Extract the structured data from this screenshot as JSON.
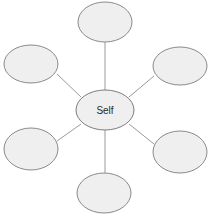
{
  "diagram": {
    "type": "radial-web-diagram",
    "canvas": {
      "width": 210,
      "height": 217,
      "background": "#ffffff"
    },
    "style": {
      "node_fill": "#efefef",
      "node_stroke": "#8a8a8a",
      "connector_stroke": "#9a9a9a",
      "label_color": "#2a2a2a"
    },
    "center": {
      "label": "Self",
      "cx": 105,
      "cy": 110,
      "rx": 29,
      "ry": 20
    },
    "satellites": [
      {
        "id": "top",
        "label": "",
        "cx": 105,
        "cy": 22,
        "rx": 27,
        "ry": 20
      },
      {
        "id": "upper-left",
        "label": "",
        "cx": 31,
        "cy": 64,
        "rx": 27,
        "ry": 19
      },
      {
        "id": "upper-right",
        "label": "",
        "cx": 180,
        "cy": 66,
        "rx": 27,
        "ry": 19
      },
      {
        "id": "lower-left",
        "label": "",
        "cx": 31,
        "cy": 149,
        "rx": 27,
        "ry": 21
      },
      {
        "id": "lower-right",
        "label": "",
        "cx": 180,
        "cy": 152,
        "rx": 27,
        "ry": 21
      },
      {
        "id": "bottom",
        "label": "",
        "cx": 104,
        "cy": 193,
        "rx": 27,
        "ry": 20
      }
    ],
    "connectors": [
      {
        "id": "center-to-top",
        "x1": 105,
        "y1": 90,
        "x2": 105,
        "y2": 42
      },
      {
        "id": "center-to-upper-left",
        "x1": 81,
        "y1": 97,
        "x2": 57,
        "y2": 74
      },
      {
        "id": "center-to-upper-right",
        "x1": 129,
        "y1": 97,
        "x2": 154,
        "y2": 76
      },
      {
        "id": "center-to-lower-left",
        "x1": 81,
        "y1": 124,
        "x2": 57,
        "y2": 141
      },
      {
        "id": "center-to-lower-right",
        "x1": 129,
        "y1": 124,
        "x2": 154,
        "y2": 144
      },
      {
        "id": "center-to-bottom",
        "x1": 105,
        "y1": 130,
        "x2": 105,
        "y2": 173
      }
    ]
  }
}
